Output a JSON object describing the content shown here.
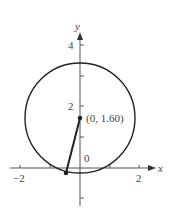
{
  "diagram": {
    "axes": {
      "x_label": "x",
      "y_label": "y",
      "x_ticks": [
        {
          "value": -2,
          "label": "−2"
        },
        {
          "value": 2,
          "label": "2"
        }
      ],
      "y_ticks": [
        {
          "value": 4,
          "label": "4"
        },
        {
          "value": 2,
          "label": "2"
        }
      ],
      "origin_label": "0"
    },
    "circle": {
      "center": [
        0,
        1.6
      ],
      "radius": 1.85
    },
    "center_point": {
      "label": "(0, 1.60)"
    },
    "segment": {
      "from": [
        0,
        1.6
      ],
      "to": [
        -0.47,
        -0.17
      ]
    },
    "colors": {
      "stroke": "#222222",
      "axis": "#555555",
      "text": "#444444"
    }
  }
}
